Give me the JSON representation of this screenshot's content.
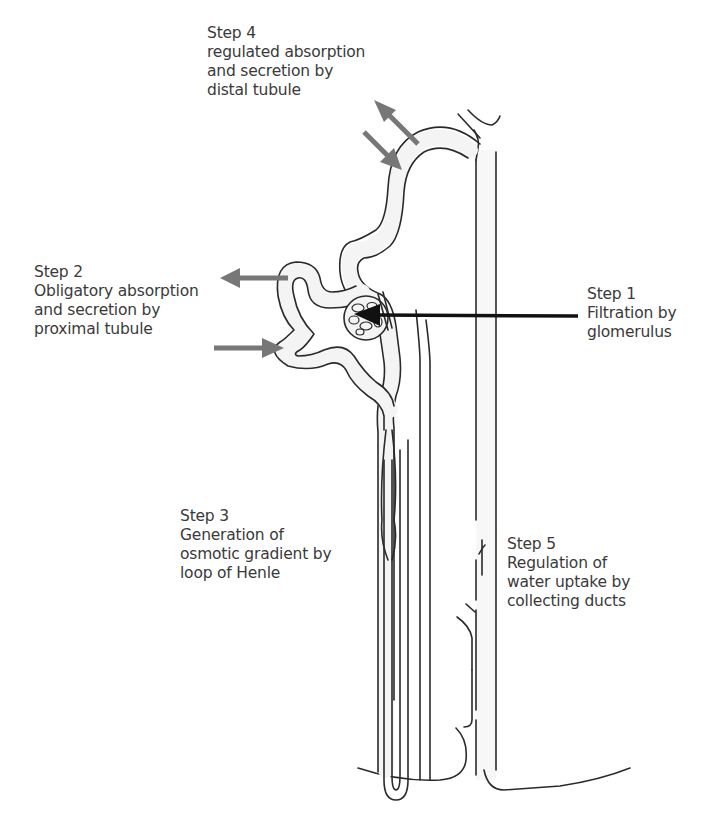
{
  "diagram": {
    "colors": {
      "line": "#2a2a2a",
      "tube_fill": "#f4f4f4",
      "gray_arrow": "#777777",
      "black_arrow": "#111111",
      "text": "#3a3a3a"
    },
    "labels": {
      "step4": {
        "heading": "Step 4",
        "line1": "regulated absorption",
        "line2": "and secretion by",
        "line3": "distal tubule"
      },
      "step2": {
        "heading": "Step 2",
        "line1": "Obligatory absorption",
        "line2": "and secretion by",
        "line3": "proximal tubule"
      },
      "step1": {
        "heading": "Step 1",
        "line1": "Filtration by",
        "line2": "glomerulus"
      },
      "step3": {
        "heading": "Step 3",
        "line1": "Generation of",
        "line2": "osmotic gradient by",
        "line3": "loop of Henle"
      },
      "step5": {
        "heading": "Step 5",
        "line1": "Regulation of",
        "line2": "water uptake by",
        "line3": "collecting ducts"
      }
    },
    "structures": [
      "glomerulus",
      "proximal tubule",
      "loop of Henle",
      "distal tubule",
      "collecting duct"
    ],
    "arrows": [
      {
        "type": "gray-out",
        "near": "distal tubule"
      },
      {
        "type": "gray-in",
        "near": "distal tubule"
      },
      {
        "type": "gray-out",
        "near": "proximal tubule"
      },
      {
        "type": "gray-in",
        "near": "proximal tubule"
      },
      {
        "type": "black-pointer",
        "target": "glomerulus"
      }
    ]
  }
}
